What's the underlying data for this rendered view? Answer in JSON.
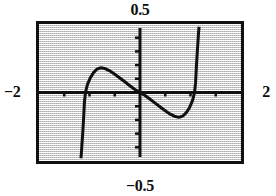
{
  "figure": {
    "kind": "graphing-calculator-plot",
    "labels": {
      "top": "0.5",
      "bottom": "−0.5",
      "left": "−2",
      "right": "2"
    },
    "colors": {
      "screen_background": "#d9d9d9",
      "frame": "#111111",
      "ink": "#101010"
    }
  },
  "chart_data": {
    "type": "line",
    "title": "",
    "xlabel": "",
    "ylabel": "",
    "xlim": [
      -2,
      2
    ],
    "ylim": [
      -0.5,
      0.5
    ],
    "grid": false,
    "legend": false,
    "legend_position": "none",
    "tick_labels": {
      "x": [
        "-2",
        "2"
      ],
      "y": [
        "-0.5",
        "0.5"
      ]
    },
    "x_axis_ticks": [
      -1.5,
      -1.0,
      -0.5,
      0.5,
      1.0,
      1.5
    ],
    "y_axis_ticks": [
      -0.4,
      -0.3,
      -0.2,
      -0.1,
      0.1,
      0.2,
      0.3,
      0.4
    ],
    "annotations": [
      "odd function with vertical asymptotes near x = -1.15 and x = 1.15",
      "local maximum near (-0.75, 0.18)",
      "local minimum near (0.75, -0.17)",
      "curve passes through the origin"
    ],
    "series": [
      {
        "name": "curve-left-lower",
        "comment": "branch descending to the lower-left of the asymptote",
        "x": [
          -1.17,
          -1.16,
          -1.15,
          -1.14,
          -1.13,
          -1.12,
          -1.11,
          -1.1,
          -1.08
        ],
        "y": [
          -0.48,
          -0.44,
          -0.38,
          -0.33,
          -0.27,
          -0.21,
          -0.14,
          -0.07,
          0.0
        ]
      },
      {
        "name": "curve-left-upper",
        "comment": "hump above the x-axis on the left half, decaying toward y=0",
        "x": [
          -1.08,
          -1.04,
          -0.98,
          -0.92,
          -0.86,
          -0.8,
          -0.75,
          -0.68,
          -0.6,
          -0.5,
          -0.4,
          -0.3,
          -0.22,
          -0.16,
          -0.1,
          -0.05,
          0.0
        ],
        "y": [
          0.0,
          0.06,
          0.11,
          0.145,
          0.168,
          0.178,
          0.18,
          0.173,
          0.158,
          0.133,
          0.106,
          0.078,
          0.055,
          0.038,
          0.022,
          0.01,
          0.0
        ]
      },
      {
        "name": "curve-right-lower",
        "comment": "dip below the x-axis on the right half reaching the minimum",
        "x": [
          0.0,
          0.05,
          0.1,
          0.16,
          0.22,
          0.3,
          0.4,
          0.5,
          0.6,
          0.68,
          0.75,
          0.8,
          0.86,
          0.92,
          0.98,
          1.04,
          1.08
        ],
        "y": [
          0.0,
          -0.01,
          -0.022,
          -0.038,
          -0.055,
          -0.078,
          -0.106,
          -0.133,
          -0.158,
          -0.173,
          -0.18,
          -0.178,
          -0.168,
          -0.145,
          -0.111,
          -0.06,
          0.0
        ]
      },
      {
        "name": "curve-right-upper",
        "comment": "branch ascending steeply to the upper-right of the asymptote",
        "x": [
          1.08,
          1.1,
          1.11,
          1.12,
          1.13,
          1.14,
          1.15,
          1.16,
          1.17
        ],
        "y": [
          0.0,
          0.07,
          0.14,
          0.21,
          0.27,
          0.33,
          0.38,
          0.44,
          0.48
        ]
      }
    ]
  }
}
